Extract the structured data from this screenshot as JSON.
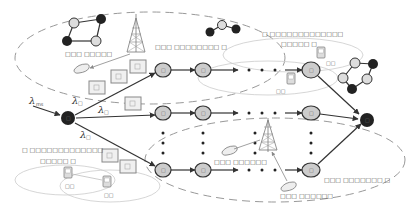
{
  "diagram": {
    "title": "",
    "labels": {
      "source_rate": "λ",
      "source_rate_sub": "ms",
      "path_rate_1": "λ",
      "path_rate_1_sub": "□",
      "path_rate_2": "λ",
      "path_rate_2_sub": "□",
      "path_rate_3": "λ",
      "path_rate_3_sub": "□",
      "top_network_label": "□□□ □□□□□",
      "top_cluster_label": "□□□ □□□□□□□□ □",
      "top_right_cluster_label_line1": "□ □□□□□□□□□□□□□",
      "top_right_cluster_label_line2": "□□□□□ □",
      "left_cluster_label_line1": "□ □□□□□□□□□□□□□",
      "left_cluster_label_line2": "□□□□□ □",
      "bottom_right_cluster_label": "□□□ □□□□□□□ □",
      "bottom_phone_label_1": "□□□ □□□□□□",
      "bottom_phone_label_2": "□□□ □□□□□□",
      "device_tag": "□□",
      "node_tag": "□"
    },
    "source_node": {
      "name": "source",
      "label": "□"
    },
    "sink_node": {
      "name": "sink",
      "label": "□"
    },
    "paths": [
      {
        "name": "path-1",
        "nodes": [
          "□",
          "□",
          "□"
        ]
      },
      {
        "name": "path-2",
        "nodes": [
          "□",
          "□",
          "□"
        ]
      },
      {
        "name": "path-3",
        "nodes": [
          "□",
          "□",
          "□"
        ]
      }
    ],
    "ellipsis": "• • •"
  }
}
